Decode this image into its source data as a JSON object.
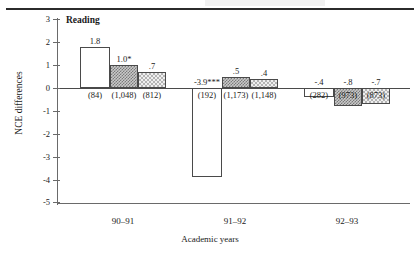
{
  "figure": {
    "panel_title": "Reading"
  },
  "chart_data": {
    "type": "bar",
    "title": "Reading",
    "xlabel": "Academic years",
    "ylabel": "NCE differences",
    "categories": [
      "90–91",
      "91–92",
      "92–93"
    ],
    "ylim": [
      -5,
      3
    ],
    "yticks": [
      "3",
      "2",
      "1",
      "0",
      "-1",
      "-2",
      "-3",
      "-4",
      "-5"
    ],
    "grid": false,
    "legend": "none",
    "series": [
      {
        "name": "open",
        "fill": "white",
        "values": [
          1.8,
          -3.9,
          -0.4
        ],
        "value_labels": [
          "1.8",
          "-3.9***",
          "-.4"
        ],
        "n_labels": [
          "(84)",
          "(192)",
          "(282)"
        ]
      },
      {
        "name": "dark-hatched",
        "fill": "dark-checker",
        "values": [
          1.0,
          0.5,
          -0.8
        ],
        "value_labels": [
          "1.0*",
          ".5",
          "-.8"
        ],
        "n_labels": [
          "(1,048)",
          "(1,173)",
          "(973)"
        ]
      },
      {
        "name": "light-hatched",
        "fill": "light-checker",
        "values": [
          0.7,
          0.4,
          -0.7
        ],
        "value_labels": [
          ".7",
          ".4",
          "-.7"
        ],
        "n_labels": [
          "(812)",
          "(1,148)",
          "(873)"
        ]
      }
    ]
  }
}
